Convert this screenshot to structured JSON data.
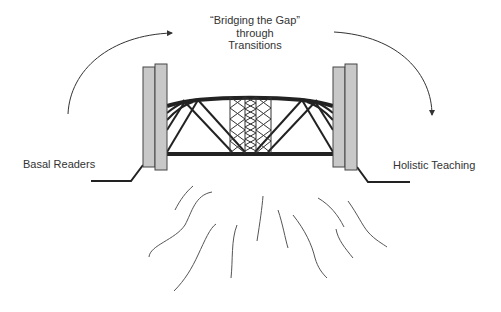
{
  "title": {
    "line1": "“Bridging the Gap”",
    "line2": "through",
    "line3": "Transitions"
  },
  "labels": {
    "left": "Basal Readers",
    "right": "Holistic Teaching"
  },
  "icons": {
    "left_arrow": "curved-arrow-up-right-icon",
    "right_arrow": "curved-arrow-down-right-icon",
    "bridge": "bridge-icon",
    "water": "wavy-lines-icon"
  },
  "colors": {
    "pillar_fill": "#c8c8c8",
    "pillar_stroke": "#444444",
    "truss": "#222222",
    "text": "#333333"
  }
}
